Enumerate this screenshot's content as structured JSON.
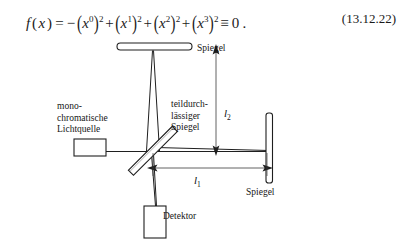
{
  "page": {
    "background_color": "#ffffff",
    "ink_color": "#1a1a1a"
  },
  "equation": {
    "number": "(13.12.22)",
    "function_name": "f",
    "variable": "x",
    "lhs": "f(x)",
    "plain_text": "f(x) = -(x^0)^2 + (x^1)^2 + (x^2)^2 + (x^3)^2 = 0 .",
    "equals": "=",
    "identity_sign": "≡",
    "minus_sign": "−",
    "plus_sign": "+",
    "open_paren": "(",
    "close_paren": ")",
    "terms": [
      {
        "sign": "−",
        "base": "x",
        "superscript": "0",
        "power": "2"
      },
      {
        "sign": "+",
        "base": "x",
        "superscript": "1",
        "power": "2"
      },
      {
        "sign": "+",
        "base": "x",
        "superscript": "2",
        "power": "2"
      },
      {
        "sign": "+",
        "base": "x",
        "superscript": "3",
        "power": "2"
      }
    ],
    "right_hand_side": "0",
    "terminator": "."
  },
  "figure": {
    "labels": {
      "source": "mono-\nchromatische\nLichtquelle",
      "source_line_1": "mono-",
      "source_line_2": "chromatische",
      "source_line_3": "Lichtquelle",
      "beam_splitter_line_1": "teildurch-",
      "beam_splitter_line_2": "lässiger",
      "beam_splitter_line_3": "Spiegel",
      "mirror_top": "Spiegel",
      "mirror_right": "Spiegel",
      "detector": "Detektor"
    },
    "dimensions": {
      "vertical_arm": {
        "symbol": "l",
        "subscript": "2"
      },
      "horizontal_arm": {
        "symbol": "l",
        "subscript": "1"
      }
    }
  }
}
